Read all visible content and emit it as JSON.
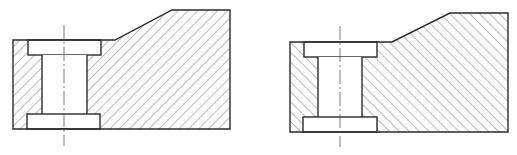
{
  "figure": {
    "colors": {
      "line": "#2a2a2a",
      "background": "#ffffff",
      "centerline": "#555555"
    },
    "views": [
      {
        "id": "left-view",
        "label": "",
        "hatch_direction": "forward-slash",
        "outline": [
          [
            13,
            40
          ],
          [
            115,
            40
          ],
          [
            172,
            10
          ],
          [
            230,
            10
          ],
          [
            230,
            129
          ],
          [
            13,
            129
          ]
        ],
        "counterbore_top": {
          "x": 28,
          "y": 40,
          "w": 73,
          "h": 15
        },
        "through_hole": {
          "x": 42,
          "y": 55,
          "w": 45,
          "h": 59
        },
        "counterbore_bottom": {
          "x": 27,
          "y": 114,
          "w": 73,
          "h": 15
        },
        "centerline_x": 64
      },
      {
        "id": "right-view",
        "label": "",
        "hatch_direction": "back-slash",
        "outline": [
          [
            290,
            42
          ],
          [
            392,
            42
          ],
          [
            450,
            13
          ],
          [
            508,
            13
          ],
          [
            508,
            132
          ],
          [
            290,
            132
          ]
        ],
        "counterbore_top": {
          "x": 304,
          "y": 42,
          "w": 73,
          "h": 15
        },
        "through_hole": {
          "x": 318,
          "y": 57,
          "w": 44,
          "h": 60
        },
        "counterbore_bottom": {
          "x": 303,
          "y": 117,
          "w": 74,
          "h": 15
        },
        "centerline_x": 340
      }
    ]
  }
}
